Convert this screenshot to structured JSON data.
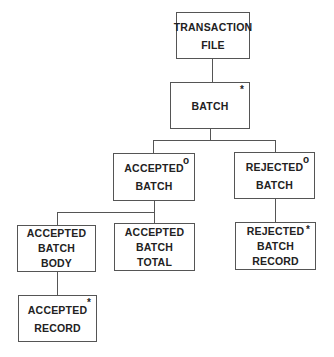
{
  "diagram": {
    "type": "jackson-structure-diagram",
    "nodes": [
      {
        "id": "transaction_file",
        "lines": [
          "TRANSACTION",
          "FILE"
        ],
        "marker": ""
      },
      {
        "id": "batch",
        "lines": [
          "BATCH"
        ],
        "marker": "*"
      },
      {
        "id": "accepted_batch",
        "lines": [
          "ACCEPTED",
          "BATCH"
        ],
        "marker": "o"
      },
      {
        "id": "rejected_batch",
        "lines": [
          "REJECTED",
          "BATCH"
        ],
        "marker": "o"
      },
      {
        "id": "accepted_batch_body",
        "lines": [
          "ACCEPTED",
          "BATCH",
          "BODY"
        ],
        "marker": ""
      },
      {
        "id": "accepted_batch_total",
        "lines": [
          "ACCEPTED",
          "BATCH",
          "TOTAL"
        ],
        "marker": ""
      },
      {
        "id": "rejected_batch_record",
        "lines": [
          "REJECTED",
          "BATCH",
          "RECORD"
        ],
        "marker": "*"
      },
      {
        "id": "accepted_record",
        "lines": [
          "ACCEPTED",
          "RECORD"
        ],
        "marker": "*"
      }
    ],
    "edges": [
      [
        "transaction_file",
        "batch"
      ],
      [
        "batch",
        "accepted_batch"
      ],
      [
        "batch",
        "rejected_batch"
      ],
      [
        "accepted_batch",
        "accepted_batch_body"
      ],
      [
        "accepted_batch",
        "accepted_batch_total"
      ],
      [
        "rejected_batch",
        "rejected_batch_record"
      ],
      [
        "accepted_batch_body",
        "accepted_record"
      ]
    ]
  }
}
